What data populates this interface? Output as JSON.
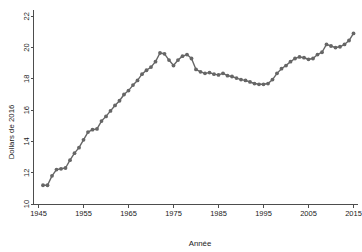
{
  "chart_data": {
    "type": "line",
    "title": "",
    "xlabel": "Année",
    "ylabel": "Dollars de 2016",
    "xlim": [
      1944,
      2016
    ],
    "ylim": [
      10,
      22.4
    ],
    "xticks": [
      1945,
      1955,
      1965,
      1975,
      1985,
      1995,
      2005,
      2015
    ],
    "xtick_labels": [
      "1945",
      "1955",
      "1965",
      "1975",
      "1985",
      "1995",
      "2005",
      "2015"
    ],
    "yticks": [
      10,
      12,
      14,
      16,
      18,
      20,
      22
    ],
    "ytick_labels": [
      "10",
      "12",
      "14",
      "16",
      "18",
      "20",
      "22"
    ],
    "grid": false,
    "legend": false,
    "marker": "circle",
    "series_color": "#666666",
    "x": [
      1946,
      1947,
      1948,
      1949,
      1950,
      1951,
      1952,
      1953,
      1954,
      1955,
      1956,
      1957,
      1958,
      1959,
      1960,
      1961,
      1962,
      1963,
      1964,
      1965,
      1966,
      1967,
      1968,
      1969,
      1970,
      1971,
      1972,
      1973,
      1974,
      1975,
      1976,
      1977,
      1978,
      1979,
      1980,
      1981,
      1982,
      1983,
      1984,
      1985,
      1986,
      1987,
      1988,
      1989,
      1990,
      1991,
      1992,
      1993,
      1994,
      1995,
      1996,
      1997,
      1998,
      1999,
      2000,
      2001,
      2002,
      2003,
      2004,
      2005,
      2006,
      2007,
      2008,
      2009,
      2010,
      2011,
      2012,
      2013,
      2014,
      2015
    ],
    "values": [
      11.2,
      11.2,
      11.8,
      12.2,
      12.25,
      12.3,
      12.8,
      13.25,
      13.6,
      14.1,
      14.6,
      14.75,
      14.8,
      15.3,
      15.6,
      15.95,
      16.3,
      16.6,
      17.0,
      17.25,
      17.6,
      17.9,
      18.3,
      18.55,
      18.75,
      19.1,
      19.65,
      19.6,
      19.2,
      18.85,
      19.2,
      19.45,
      19.55,
      19.3,
      18.6,
      18.45,
      18.35,
      18.4,
      18.3,
      18.25,
      18.35,
      18.2,
      18.15,
      18.05,
      17.95,
      17.9,
      17.8,
      17.7,
      17.65,
      17.65,
      17.7,
      17.95,
      18.35,
      18.65,
      18.85,
      19.1,
      19.3,
      19.4,
      19.35,
      19.25,
      19.3,
      19.55,
      19.7,
      20.2,
      20.1,
      20.0,
      20.05,
      20.2,
      20.45,
      20.9
    ]
  }
}
